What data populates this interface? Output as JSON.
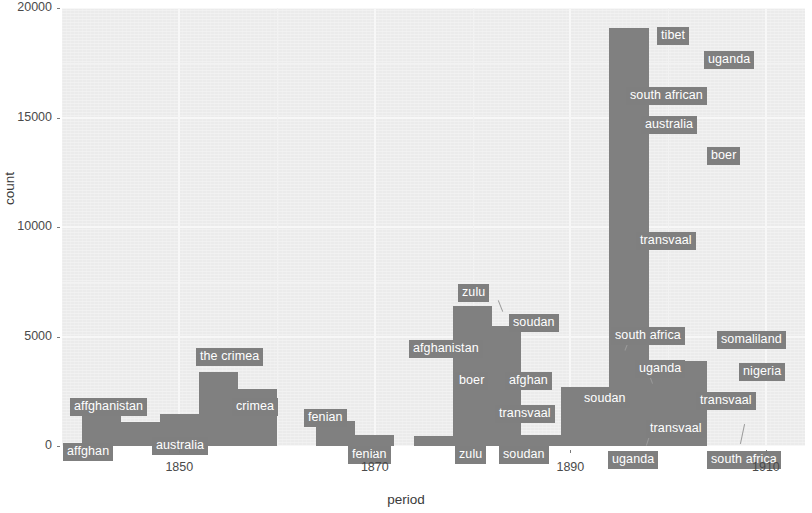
{
  "chart_data": {
    "type": "bar",
    "title": "",
    "subtitle": "",
    "xlabel": "period",
    "ylabel": "count",
    "xlim": [
      1838,
      1914
    ],
    "ylim": [
      0,
      20000
    ],
    "grid": true,
    "legend": "none",
    "bar_width_years": 4,
    "yticks": [
      0,
      5000,
      10000,
      15000,
      20000
    ],
    "ytick_labels": [
      "0",
      "5000",
      "10000",
      "15000",
      "20000"
    ],
    "xticks": [
      1850,
      1870,
      1890,
      1910
    ],
    "xtick_labels": [
      "1850",
      "1870",
      "1890",
      "1910"
    ],
    "x": [
      1841,
      1845,
      1849,
      1853,
      1857,
      1861,
      1865,
      1869,
      1873,
      1877,
      1881,
      1885,
      1889,
      1893,
      1897,
      1901
    ],
    "values": [
      2150,
      1100,
      1450,
      3400,
      2600,
      500,
      1150,
      450,
      420,
      380,
      6400,
      5500,
      1100,
      2700,
      19100,
      3900
    ],
    "bars": [
      {
        "label_top": "affghanistan",
        "label_bottom": "affghan",
        "x0": 1840.0,
        "x1": 1844.0,
        "value": 2150
      },
      {
        "label_top": "",
        "label_bottom": "",
        "x0": 1844.0,
        "x1": 1848.0,
        "value": 1100
      },
      {
        "label_top": "",
        "label_bottom": "australia",
        "x0": 1848.0,
        "x1": 1852.0,
        "value": 1450
      },
      {
        "label_top": "the crimea",
        "label_bottom": "crimea",
        "x0": 1852.0,
        "x1": 1856.0,
        "value": 3400
      },
      {
        "label_top": "",
        "label_bottom": "",
        "x0": 1856.0,
        "x1": 1860.0,
        "value": 2600
      },
      {
        "label_top": "fenian",
        "label_bottom": "fenian",
        "x0": 1864.0,
        "x1": 1868.0,
        "value": 1150
      },
      {
        "label_top": "",
        "label_bottom": "",
        "x0": 1868.0,
        "x1": 1872.0,
        "value": 500
      },
      {
        "label_top": "",
        "label_bottom": "zulu",
        "x0": 1874.0,
        "x1": 1878.0,
        "value": 450
      },
      {
        "label_top": "zulu",
        "label_bottom": "soudan",
        "x0": 1878.0,
        "x1": 1882.0,
        "value": 6400
      },
      {
        "label_top": "soudan",
        "label_bottom": "",
        "x0": 1882.0,
        "x1": 1885.0,
        "value": 5500
      },
      {
        "label_top": "",
        "label_bottom": "",
        "x0": 1885.0,
        "x1": 1889.0,
        "value": 500
      },
      {
        "label_top": "uganda",
        "label_bottom": "uganda",
        "x0": 1889.0,
        "x1": 1894.0,
        "value": 2700
      },
      {
        "label_top": "tibet",
        "label_bottom": "transvaal",
        "x0": 1894.0,
        "x1": 1898.0,
        "value": 19100
      },
      {
        "label_top": "somaliland",
        "label_bottom": "south africa",
        "x0": 1898.0,
        "x1": 1904.0,
        "value": 3900
      }
    ],
    "annotations": [
      {
        "text": "affghanistan",
        "x": 70,
        "y": 398
      },
      {
        "text": "affghan",
        "x": 63,
        "y": 443
      },
      {
        "text": "australia",
        "x": 152,
        "y": 437
      },
      {
        "text": "the crimea",
        "x": 196,
        "y": 348
      },
      {
        "text": "crimea",
        "x": 232,
        "y": 398
      },
      {
        "text": "fenian",
        "x": 304,
        "y": 409
      },
      {
        "text": "fenian",
        "x": 348,
        "y": 446
      },
      {
        "text": "zulu",
        "x": 455,
        "y": 446
      },
      {
        "text": "soudan",
        "x": 499,
        "y": 446
      },
      {
        "text": "zulu",
        "x": 458,
        "y": 284
      },
      {
        "text": "soudan",
        "x": 509,
        "y": 314
      },
      {
        "text": "afghanistan",
        "x": 409,
        "y": 340
      },
      {
        "text": "boer",
        "x": 455,
        "y": 372
      },
      {
        "text": "afghan",
        "x": 505,
        "y": 372
      },
      {
        "text": "transvaal",
        "x": 495,
        "y": 405
      },
      {
        "text": "south africa",
        "x": 611,
        "y": 327
      },
      {
        "text": "uganda",
        "x": 635,
        "y": 360
      },
      {
        "text": "soudan",
        "x": 580,
        "y": 390
      },
      {
        "text": "uganda",
        "x": 608,
        "y": 451
      },
      {
        "text": "transvaal",
        "x": 646,
        "y": 420
      },
      {
        "text": "tibet",
        "x": 657,
        "y": 27
      },
      {
        "text": "uganda",
        "x": 704,
        "y": 51
      },
      {
        "text": "south african",
        "x": 626,
        "y": 87
      },
      {
        "text": "australia",
        "x": 641,
        "y": 116
      },
      {
        "text": "boer",
        "x": 707,
        "y": 147
      },
      {
        "text": "transvaal",
        "x": 636,
        "y": 232
      },
      {
        "text": "somaliland",
        "x": 717,
        "y": 331
      },
      {
        "text": "nigeria",
        "x": 739,
        "y": 363
      },
      {
        "text": "transvaal",
        "x": 696,
        "y": 392
      },
      {
        "text": "south africa",
        "x": 707,
        "y": 451
      }
    ]
  },
  "axes": {
    "ylabel": "count",
    "xlabel": "period",
    "yticks": [
      {
        "label": "20000",
        "value": 20000
      },
      {
        "label": "15000",
        "value": 15000
      },
      {
        "label": "10000",
        "value": 10000
      },
      {
        "label": "5000",
        "value": 5000
      },
      {
        "label": "0",
        "value": 0
      }
    ],
    "xticks": [
      {
        "label": "1850",
        "value": 1850
      },
      {
        "label": "1870",
        "value": 1870
      },
      {
        "label": "1890",
        "value": 1890
      },
      {
        "label": "1910",
        "value": 1910
      }
    ]
  },
  "style": {
    "panel_bg": "#ebebeb",
    "bar_color": "#808080",
    "label_bg": "#7f7f7f",
    "label_fg": "#ffffff",
    "grid_color": "#f7f7f7",
    "text_color": "#3a3a3a"
  }
}
